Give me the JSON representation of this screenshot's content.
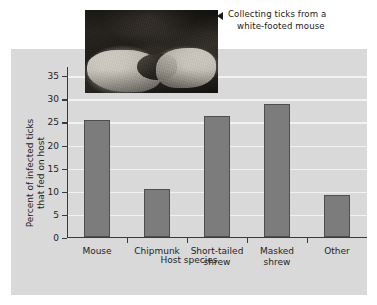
{
  "figure": {
    "background_color": "#ffffff",
    "panel_color": "#d9d9d9",
    "bar_color": "#7c7c7c",
    "bar_edge_color": "#4e4e4e",
    "gridline_color": "#f2f2f2",
    "axis_color": "#3a3a3a"
  },
  "caption": {
    "arrow": "left-triangle",
    "line1": "Collecting ticks from a",
    "line2": "white-footed mouse"
  },
  "photo": {
    "alt": "Gloved hands holding a white-footed mouse while collecting ticks"
  },
  "chart_data": {
    "type": "bar",
    "title": "",
    "xlabel": "Host species",
    "ylabel": "Percent of infected ticks that fed on host",
    "ylabel_line1": "Percent of infected ticks",
    "ylabel_line2": "that fed on host",
    "categories": [
      "Mouse",
      "Chipmunk",
      "Short-tailed shrew",
      "Masked shrew",
      "Other"
    ],
    "category_lines": [
      [
        "Mouse"
      ],
      [
        "Chipmunk"
      ],
      [
        "Short-tailed",
        "shrew"
      ],
      [
        "Masked",
        "shrew"
      ],
      [
        "Other"
      ]
    ],
    "values": [
      25.3,
      10.4,
      26.0,
      28.8,
      9.1
    ],
    "ylim": [
      0,
      37
    ],
    "yticks": [
      0,
      5,
      10,
      15,
      20,
      25,
      30,
      35
    ],
    "ytick_labels": [
      "0",
      "5",
      "10",
      "15",
      "20",
      "25",
      "30",
      "35"
    ],
    "grid": true,
    "legend": false
  }
}
